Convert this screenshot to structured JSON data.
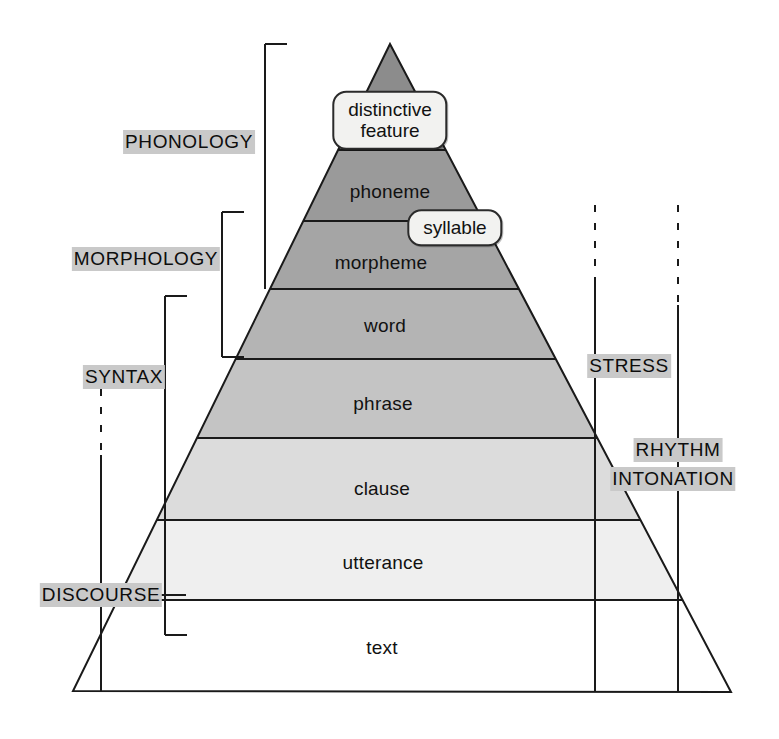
{
  "figure": {
    "kind": "linguistic-hierarchy-pyramid",
    "background_color": "#ffffff",
    "outline_color": "#1a1a1a",
    "label_highlight_color": "#c9c9c9"
  },
  "pyramid": {
    "apex": {
      "x": 390,
      "y": 44
    },
    "base_left": {
      "x": 73,
      "y": 691
    },
    "base_right": {
      "x": 731,
      "y": 692
    },
    "levels": [
      {
        "name": "distinctive feature",
        "label": "",
        "y_top": 44,
        "y_bottom": 150,
        "fill": "#8c8c8c"
      },
      {
        "name": "phoneme",
        "label": "phoneme",
        "y_top": 150,
        "y_bottom": 221,
        "fill": "#9a9a9a",
        "label_x": 390,
        "label_y": 192
      },
      {
        "name": "morpheme",
        "label": "morpheme",
        "y_top": 221,
        "y_bottom": 289,
        "fill": "#a5a5a5",
        "label_x": 381,
        "label_y": 263
      },
      {
        "name": "word",
        "label": "word",
        "y_top": 289,
        "y_bottom": 359,
        "fill": "#b4b4b4",
        "label_x": 385,
        "label_y": 326
      },
      {
        "name": "phrase",
        "label": "phrase",
        "y_top": 359,
        "y_bottom": 438,
        "fill": "#c4c4c4",
        "label_x": 383,
        "label_y": 404
      },
      {
        "name": "clause",
        "label": "clause",
        "y_top": 438,
        "y_bottom": 520,
        "fill": "#dcdcdc",
        "label_x": 382,
        "label_y": 489
      },
      {
        "name": "utterance",
        "label": "utterance",
        "y_top": 520,
        "y_bottom": 600,
        "fill": "#efefef",
        "label_x": 383,
        "label_y": 563
      },
      {
        "name": "text",
        "label": "text",
        "y_top": 600,
        "y_bottom": 691,
        "fill": "#ffffff",
        "label_x": 382,
        "label_y": 648
      }
    ]
  },
  "callouts": [
    {
      "id": "distinctive-feature",
      "line1": "distinctive",
      "line2": "feature",
      "x": 390,
      "y": 120
    },
    {
      "id": "syllable",
      "line1": "syllable",
      "line2": "",
      "x": 455,
      "y": 228
    }
  ],
  "left_brackets": [
    {
      "id": "phonology",
      "label": "PHONOLOGY",
      "label_x": 189,
      "label_y": 142,
      "spine_x": 265,
      "y_top": 44,
      "y_bottom": 289,
      "tick_len": 22,
      "top_tick": true,
      "bottom_tick": false
    },
    {
      "id": "morphology",
      "label": "MORPHOLOGY",
      "label_x": 146,
      "label_y": 259,
      "spine_x": 222,
      "y_top": 212,
      "y_bottom": 357,
      "tick_len": 22,
      "top_tick": true,
      "bottom_tick": true
    },
    {
      "id": "syntax",
      "label": "SYNTAX",
      "label_x": 124,
      "label_y": 377,
      "spine_x": 165,
      "y_top": 296,
      "y_bottom": 635,
      "tick_len": 22,
      "top_tick": true,
      "bottom_tick": true
    }
  ],
  "vertical_markers": [
    {
      "id": "discourse",
      "label": "DISCOURSE",
      "label_x": 101,
      "label_y": 595,
      "x": 101,
      "dash_top": 389,
      "dash_bottom": 455,
      "solid_top": 455,
      "solid_bottom": 691,
      "connector_to_x": 186,
      "connector_y": 595
    },
    {
      "id": "stress",
      "label": "STRESS",
      "label_x": 629,
      "label_y": 366,
      "x": 595,
      "dash_top": 205,
      "dash_bottom": 280,
      "solid_top": 280,
      "solid_bottom": 692,
      "connector_to_x": null,
      "connector_y": null
    },
    {
      "id": "rhythm-intonation",
      "label_line1": "RHYTHM",
      "label_line2": "INTONATION",
      "label_x": 678,
      "label_y": 450,
      "label2_x": 673,
      "label2_y": 479,
      "x": 678,
      "dash_top": 205,
      "dash_bottom": 305,
      "solid_top": 305,
      "solid_bottom": 692,
      "connector_to_x": null,
      "connector_y": null
    }
  ]
}
